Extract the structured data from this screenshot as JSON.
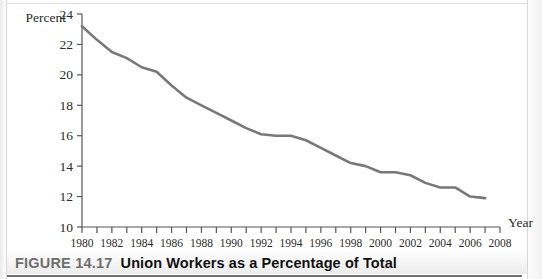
{
  "figure": {
    "number_label": "FIGURE 14.17",
    "title": "Union Workers as a Percentage of Total"
  },
  "chart_data": {
    "type": "line",
    "title": "Union Workers as a Percentage of Total",
    "xlabel": "Year",
    "ylabel": "Percent",
    "xlim": [
      1980,
      2008
    ],
    "ylim": [
      10,
      24
    ],
    "grid": false,
    "legend": null,
    "y_ticks": [
      10,
      12,
      14,
      16,
      18,
      20,
      22,
      24
    ],
    "y_tick_labels": [
      "10",
      "12",
      "14",
      "16",
      "18",
      "20",
      "22",
      "24"
    ],
    "x_ticks": [
      1980,
      1981,
      1982,
      1983,
      1984,
      1985,
      1986,
      1987,
      1988,
      1989,
      1990,
      1991,
      1992,
      1993,
      1994,
      1995,
      1996,
      1997,
      1998,
      1999,
      2000,
      2001,
      2002,
      2003,
      2004,
      2005,
      2006,
      2007,
      2008
    ],
    "x_tick_labels": [
      "1980",
      "",
      "1982",
      "",
      "1984",
      "",
      "1986",
      "",
      "1988",
      "",
      "1990",
      "",
      "1992",
      "",
      "1994",
      "",
      "1996",
      "",
      "1998",
      "",
      "2000",
      "",
      "2002",
      "",
      "2004",
      "",
      "2006",
      "",
      "2008"
    ],
    "x_labeled_ticks": [
      "1980",
      "1982",
      "1984",
      "1986",
      "1988",
      "1990",
      "1992",
      "1994",
      "1996",
      "1998",
      "2000",
      "2002",
      "2004",
      "2006",
      "2008"
    ],
    "line_color": "#787878",
    "x": [
      1980,
      1981,
      1982,
      1983,
      1984,
      1985,
      1986,
      1987,
      1988,
      1989,
      1990,
      1991,
      1992,
      1993,
      1994,
      1995,
      1996,
      1997,
      1998,
      1999,
      2000,
      2001,
      2002,
      2003,
      2004,
      2005,
      2006,
      2007
    ],
    "values": [
      23.2,
      22.3,
      21.5,
      21.1,
      20.5,
      20.2,
      19.3,
      18.5,
      18.0,
      17.5,
      17.0,
      16.5,
      16.1,
      16.0,
      16.0,
      15.7,
      15.2,
      14.7,
      14.2,
      14.0,
      13.6,
      13.6,
      13.4,
      12.9,
      12.6,
      12.6,
      12.0,
      11.9
    ]
  }
}
